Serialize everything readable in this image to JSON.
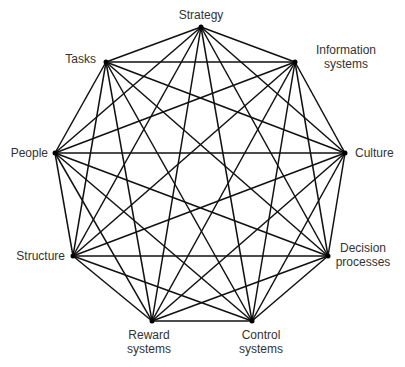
{
  "diagram": {
    "title": "",
    "type": "complete-graph",
    "edge_color": "#111111",
    "nodes": [
      {
        "id": "strategy",
        "label": "Strategy",
        "x": 201,
        "y": 27
      },
      {
        "id": "information-systems",
        "label": "Information\nsystems",
        "line1": "Information",
        "line2": "systems",
        "x": 295,
        "y": 62
      },
      {
        "id": "culture",
        "label": "Culture",
        "x": 345,
        "y": 153
      },
      {
        "id": "decision-processes",
        "label": "Decision\nprocesses",
        "line1": "Decision",
        "line2": "processes",
        "x": 328,
        "y": 256
      },
      {
        "id": "control-systems",
        "label": "Control\nsystems",
        "line1": "Control",
        "line2": "systems",
        "x": 252,
        "y": 321
      },
      {
        "id": "reward-systems",
        "label": "Reward\nsystems",
        "line1": "Reward",
        "line2": "systems",
        "x": 152,
        "y": 321
      },
      {
        "id": "structure",
        "label": "Structure",
        "x": 73,
        "y": 256
      },
      {
        "id": "people",
        "label": "People",
        "x": 55,
        "y": 153
      },
      {
        "id": "tasks",
        "label": "Tasks",
        "x": 106,
        "y": 62
      }
    ],
    "edges": "all-pairs"
  }
}
